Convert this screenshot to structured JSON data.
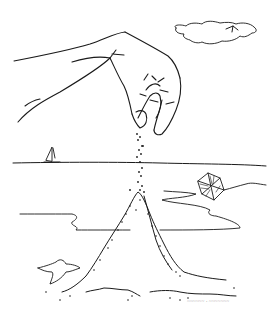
{
  "illustration": {
    "subject": "hand sprinkling sand onto a sand pile on a beach",
    "style": "pen-and-ink line drawing",
    "background": "#ffffff",
    "ink": "#1a1a1a",
    "elements": [
      "hand",
      "falling-sand",
      "cloud",
      "bird",
      "horizon",
      "sailboat",
      "kite",
      "shoreline",
      "sand-pile",
      "starfish",
      "signature"
    ]
  },
  "signature": {
    "text": "~~~~~~ · ~~~~~~~",
    "legible": false
  }
}
